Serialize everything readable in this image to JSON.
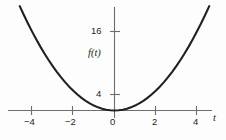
{
  "chart_data": {
    "type": "line",
    "title": "",
    "subtitle": "",
    "xlabel": "t",
    "ylabel": "f(t)",
    "function": "f(t) = t^2",
    "xlim": [
      -5.2,
      5.4
    ],
    "ylim": [
      -1.0,
      24.5
    ],
    "grid": false,
    "legend": null,
    "xticks": [
      -4,
      -2,
      0,
      2,
      4
    ],
    "xticklabels": [
      "−4",
      "−2",
      "0",
      "2",
      "4"
    ],
    "yticks": [
      4,
      16
    ],
    "yticklabels": [
      "4",
      "16"
    ],
    "series": [
      {
        "name": "f(t) = t^2",
        "color": "#231f20",
        "x": [
          -4.6,
          -4.4,
          -4.2,
          -4.0,
          -3.8,
          -3.6,
          -3.4,
          -3.2,
          -3.0,
          -2.8,
          -2.6,
          -2.4,
          -2.2,
          -2.0,
          -1.8,
          -1.6,
          -1.4,
          -1.2,
          -1.0,
          -0.8,
          -0.6,
          -0.4,
          -0.2,
          0.0,
          0.2,
          0.4,
          0.6,
          0.8,
          1.0,
          1.2,
          1.4,
          1.6,
          1.8,
          2.0,
          2.2,
          2.4,
          2.6,
          2.8,
          3.0,
          3.2,
          3.4,
          3.6,
          3.8,
          4.0,
          4.2,
          4.4,
          4.6
        ],
        "y": [
          21.16,
          19.36,
          17.64,
          16.0,
          14.44,
          12.96,
          11.56,
          10.24,
          9.0,
          7.84,
          6.76,
          5.76,
          4.84,
          4.0,
          3.24,
          2.56,
          1.96,
          1.44,
          1.0,
          0.64,
          0.36,
          0.16,
          0.04,
          0.0,
          0.04,
          0.16,
          0.36,
          0.64,
          1.0,
          1.44,
          1.96,
          2.56,
          3.24,
          4.0,
          4.84,
          5.76,
          6.76,
          7.84,
          9.0,
          10.24,
          11.56,
          12.96,
          14.44,
          16.0,
          17.64,
          19.36,
          21.16
        ]
      }
    ]
  },
  "axis_labels": {
    "x_name": "t",
    "y_name": "f(t)"
  },
  "xtick_labels": {
    "neg4": "−4",
    "neg2": "−2",
    "zero": "0",
    "pos2": "2",
    "pos4": "4"
  },
  "ytick_labels": {
    "four": "4",
    "sixteen": "16"
  },
  "colors": {
    "curve": "#231f20",
    "axis": "#6d6e71",
    "text": "#231f20",
    "background": "#fdfdfd"
  }
}
